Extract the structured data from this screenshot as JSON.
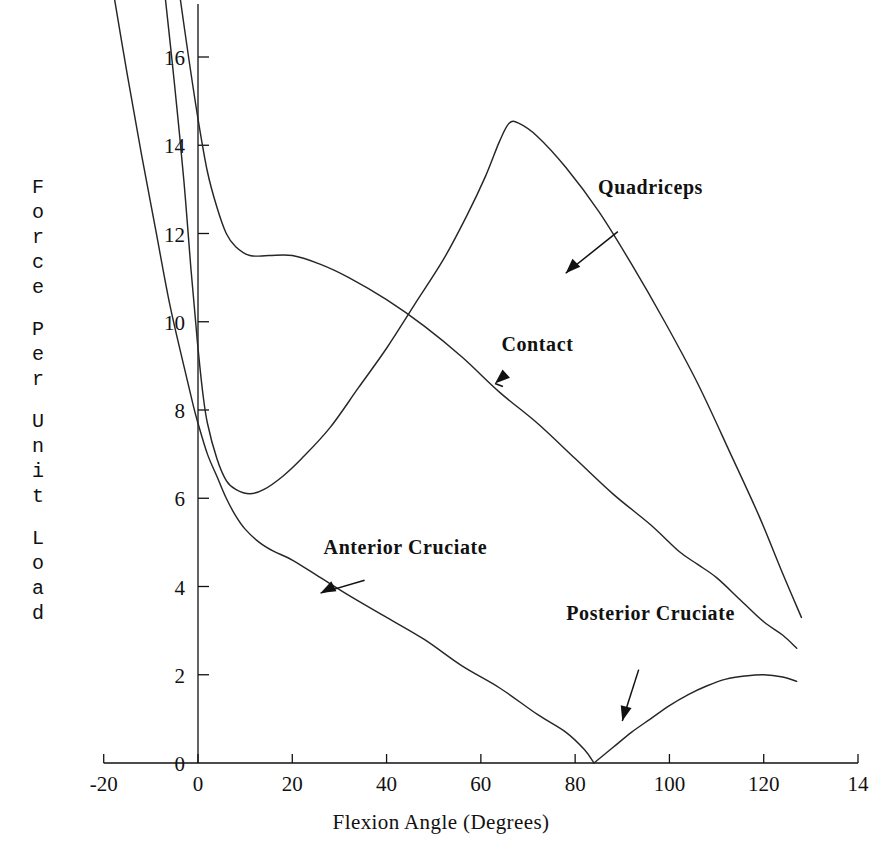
{
  "chart_data": {
    "type": "line",
    "title": "",
    "xlabel": "Flexion Angle (Degrees)",
    "ylabel": "Force Per Unit Load",
    "xlim": [
      -20,
      140
    ],
    "ylim": [
      0,
      17.2
    ],
    "xticks": [
      -20,
      0,
      20,
      40,
      60,
      80,
      100,
      120,
      140
    ],
    "xticklabels": [
      "-20",
      "0",
      "20",
      "40",
      "60",
      "80",
      "100",
      "120",
      "14"
    ],
    "yticks": [
      0,
      2,
      4,
      6,
      8,
      10,
      12,
      14,
      16
    ],
    "yticklabels": [
      "0",
      "2",
      "4",
      "6",
      "8",
      "10",
      "12",
      "14",
      "16"
    ],
    "grid": false,
    "legend": "annotations-with-arrows",
    "series": [
      {
        "name": "Quadriceps",
        "points": [
          [
            -7.0,
            17.4
          ],
          [
            -5.0,
            15.4
          ],
          [
            -3.0,
            13.2
          ],
          [
            -1.5,
            11.2
          ],
          [
            -0.5,
            10.0
          ],
          [
            0.0,
            9.4
          ],
          [
            1.0,
            8.4
          ],
          [
            2.0,
            7.7
          ],
          [
            4.0,
            6.9
          ],
          [
            6.0,
            6.4
          ],
          [
            8.0,
            6.2
          ],
          [
            11.0,
            6.1
          ],
          [
            14.0,
            6.2
          ],
          [
            18.0,
            6.5
          ],
          [
            22.0,
            6.9
          ],
          [
            28.0,
            7.6
          ],
          [
            34.0,
            8.5
          ],
          [
            40.0,
            9.4
          ],
          [
            46.0,
            10.4
          ],
          [
            52.0,
            11.4
          ],
          [
            57.0,
            12.4
          ],
          [
            61.0,
            13.3
          ],
          [
            64.0,
            14.1
          ],
          [
            66.0,
            14.5
          ],
          [
            68.0,
            14.5
          ],
          [
            72.0,
            14.2
          ],
          [
            78.0,
            13.5
          ],
          [
            85.0,
            12.5
          ],
          [
            92.0,
            11.3
          ],
          [
            99.0,
            10.0
          ],
          [
            106.0,
            8.6
          ],
          [
            113.0,
            7.0
          ],
          [
            119.0,
            5.6
          ],
          [
            124.0,
            4.3
          ],
          [
            128.0,
            3.3
          ]
        ]
      },
      {
        "name": "Contact",
        "points": [
          [
            -4.0,
            17.5
          ],
          [
            -2.0,
            16.0
          ],
          [
            0.0,
            14.6
          ],
          [
            2.0,
            13.4
          ],
          [
            4.0,
            12.6
          ],
          [
            6.0,
            12.0
          ],
          [
            8.0,
            11.7
          ],
          [
            11.0,
            11.5
          ],
          [
            15.0,
            11.5
          ],
          [
            20.0,
            11.5
          ],
          [
            26.0,
            11.3
          ],
          [
            32.0,
            11.0
          ],
          [
            40.0,
            10.5
          ],
          [
            48.0,
            9.9
          ],
          [
            56.0,
            9.2
          ],
          [
            64.0,
            8.4
          ],
          [
            72.0,
            7.7
          ],
          [
            80.0,
            6.9
          ],
          [
            88.0,
            6.1
          ],
          [
            96.0,
            5.4
          ],
          [
            102.0,
            4.8
          ],
          [
            106.0,
            4.5
          ],
          [
            110.0,
            4.2
          ],
          [
            115.0,
            3.7
          ],
          [
            120.0,
            3.2
          ],
          [
            124.0,
            2.9
          ],
          [
            127.0,
            2.6
          ]
        ]
      },
      {
        "name": "Anterior Cruciate",
        "points": [
          [
            -18.0,
            17.5
          ],
          [
            -15.0,
            15.6
          ],
          [
            -12.0,
            13.8
          ],
          [
            -9.0,
            12.1
          ],
          [
            -6.0,
            10.4
          ],
          [
            -3.0,
            9.0
          ],
          [
            -1.0,
            8.1
          ],
          [
            0.0,
            7.7
          ],
          [
            2.0,
            7.0
          ],
          [
            4.0,
            6.5
          ],
          [
            6.0,
            6.0
          ],
          [
            8.0,
            5.6
          ],
          [
            10.0,
            5.3
          ],
          [
            13.0,
            5.0
          ],
          [
            16.0,
            4.8
          ],
          [
            20.0,
            4.6
          ],
          [
            26.0,
            4.2
          ],
          [
            32.0,
            3.8
          ],
          [
            40.0,
            3.3
          ],
          [
            48.0,
            2.8
          ],
          [
            56.0,
            2.2
          ],
          [
            64.0,
            1.7
          ],
          [
            72.0,
            1.1
          ],
          [
            78.0,
            0.7
          ],
          [
            82.0,
            0.3
          ],
          [
            84.0,
            0.0
          ]
        ]
      },
      {
        "name": "Posterior Cruciate",
        "points": [
          [
            84.0,
            0.0
          ],
          [
            88.0,
            0.35
          ],
          [
            92.0,
            0.7
          ],
          [
            96.0,
            1.0
          ],
          [
            100.0,
            1.3
          ],
          [
            104.0,
            1.55
          ],
          [
            108.0,
            1.75
          ],
          [
            112.0,
            1.9
          ],
          [
            116.0,
            1.97
          ],
          [
            120.0,
            2.0
          ],
          [
            124.0,
            1.95
          ],
          [
            127.0,
            1.85
          ]
        ]
      }
    ],
    "annotations": [
      {
        "label": "Quadriceps",
        "text_xy": [
          96,
          13.0
        ],
        "arrow_to": [
          78,
          11.1
        ]
      },
      {
        "label": "Contact",
        "text_xy": [
          72,
          9.45
        ],
        "arrow_to": [
          63,
          8.6
        ]
      },
      {
        "label": "Anterior Cruciate",
        "text_xy": [
          44,
          4.85
        ],
        "arrow_to": [
          26,
          3.85
        ]
      },
      {
        "label": "Posterior Cruciate",
        "text_xy": [
          96,
          3.35
        ],
        "arrow_to": [
          90,
          0.95
        ]
      }
    ]
  },
  "axis": {
    "x_title": "Flexion Angle (Degrees)",
    "y_title": "Force Per Unit Load",
    "y_title_words": [
      "Force",
      "Per",
      "Unit",
      "Load"
    ],
    "origin_y_label": "0"
  },
  "colors": {
    "curve": "#262626",
    "axis": "#111111",
    "text": "#111111",
    "background": "#ffffff"
  }
}
